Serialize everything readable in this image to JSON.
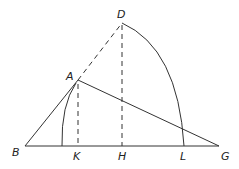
{
  "diagram": {
    "type": "geometric-construction",
    "points": {
      "A": {
        "label": "A",
        "x": 78,
        "y": 80
      },
      "B": {
        "label": "B",
        "x": 25,
        "y": 146
      },
      "D": {
        "label": "D",
        "x": 122,
        "y": 23
      },
      "G": {
        "label": "G",
        "x": 219,
        "y": 146
      },
      "H": {
        "label": "H",
        "x": 122,
        "y": 146
      },
      "K": {
        "label": "K",
        "x": 78,
        "y": 146
      },
      "L": {
        "label": "L",
        "x": 185,
        "y": 146
      }
    },
    "labels": {
      "A": "A",
      "B": "B",
      "D": "D",
      "G": "G",
      "H": "H",
      "K": "K",
      "L": "L"
    },
    "segments": [
      {
        "from": "B",
        "to": "G",
        "style": "solid"
      },
      {
        "from": "B",
        "to": "A",
        "style": "solid"
      },
      {
        "from": "A",
        "to": "G",
        "style": "solid"
      },
      {
        "from": "A",
        "to": "D",
        "style": "dashed"
      },
      {
        "from": "D",
        "to": "H",
        "style": "dashed"
      },
      {
        "from": "A",
        "to": "K",
        "style": "dashed"
      }
    ],
    "arcs": [
      {
        "from": "D",
        "to": "L",
        "style": "solid"
      },
      {
        "from": "A",
        "to": "BK",
        "style": "solid"
      }
    ]
  }
}
